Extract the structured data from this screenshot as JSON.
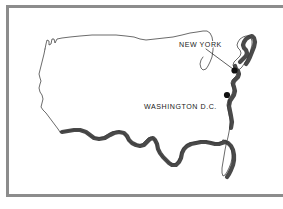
{
  "figure": {
    "background_color": "#ffffff",
    "frame_color": "#8c8c8c",
    "outline_color": "#3a3a3a",
    "shadow_color": "#4a4a4a",
    "marker_color": "#111111"
  },
  "map": {
    "region_name": "United States",
    "labels": [
      {
        "id": "new-york",
        "text": "NEW YORK",
        "text_x": 179,
        "text_y": 47,
        "marker_x": 234.5,
        "marker_y": 70.5,
        "marker_radius": 3.1,
        "leader_from_x": 206,
        "leader_from_y": 49,
        "leader_to_x": 233,
        "leader_to_y": 69
      },
      {
        "id": "washington-dc",
        "text": "WASHINGTON D.C.",
        "text_x": 144,
        "text_y": 109,
        "marker_x": 227,
        "marker_y": 95,
        "marker_radius": 3.1,
        "leader_from_x": 229,
        "leader_from_y": 105,
        "leader_to_x": 229,
        "leader_to_y": 99
      }
    ],
    "outline_path": "M 45,49 L 46,44 L 47,40 L 49,41 L 49,45 L 51,44 L 52,39 L 54,39 L 55,43 L 57,39 L 62,38 L 70,37 L 80,36 L 92,35 L 104,35 L 116,35 L 126,36 L 134,37 L 140,39 L 146,40 L 155,39 L 164,38 L 173,37 L 182,35 L 190,33 L 197,32 L 203,31 L 207,31 L 210,33 L 212,37 L 213,43 L 213,50 L 212,57 L 210,62 L 208,66 L 206,69 L 203,70 L 201,68 L 200,64 L 201,60 L 203,57",
    "west_path": "M 45,49 L 44,54 L 43,58 L 42,62 L 41,66 L 40,70 L 39,74 L 40,78 L 41,81 L 40,84 L 39,88 L 40,92 L 42,95 L 43,99 L 42,103 L 41,107 L 43,110 L 46,113 L 49,117 L 52,121 L 55,125 L 58,129 L 60,132",
    "south_path": "M 60,132 L 66,131 L 72,130 L 78,130 L 84,131 L 88,134 L 92,137 L 97,138 L 103,137 L 108,134 L 112,132 L 117,131 L 122,132 L 125,135 L 127,139 L 130,142 L 134,144 L 138,145 L 142,144 L 145,141 L 148,138 L 151,137 L 154,139 L 156,143 L 157,148 L 159,152 L 162,156 L 165,159 L 168,162 L 171,164 L 175,164 L 178,161 L 180,157 L 181,152 L 183,148 L 186,145 L 190,143 L 195,142 L 200,141 L 205,141 L 210,142 L 214,143 L 218,143 L 221,142 L 223,140",
    "east_path": "M 223,140 L 226,141 L 229,144 L 231,148 L 232,153 L 232,158 L 231,163 L 229,168 L 227,172 L 225,175 L 223,176 L 222,173 L 222,168 L 223,162 L 224,156 L 225,150 L 226,145 L 227,141 L 228,137 L 229,132 L 230,126 L 230,120 L 229,115 L 228,110 L 227,105 L 228,100 L 230,97 L 232,94 L 233,90 L 232,86 L 231,83 L 232,80 L 234,78 L 236,76 L 237,73 L 236,70 L 234,68 L 233,65 L 234,62 L 236,60 L 238,58 L 240,56 L 241,53 L 240,50 L 238,48 L 237,45 L 238,42 L 240,39 L 243,37 L 246,36 L 249,36 L 251,38 L 252,41 L 252,45 L 251,49 L 250,53 L 248,57 L 246,61 L 244,64 L 242,67 L 240,69 L 238,70",
    "shadow_segments": [
      "M 62,132 L 68,131 L 74,130 L 80,130 L 86,132 L 90,135 L 94,138 L 99,139 L 105,138 L 110,135 L 114,133 L 119,132 L 124,133 L 127,136 L 129,140 L 132,143 L 136,145 L 140,146 L 144,145 L 147,142 L 150,139 L 153,138 L 155,140 L 157,144 L 158,149 L 160,153 L 163,157 L 166,160 L 169,163 L 172,165 L 176,165 L 179,162 L 181,158 L 182,153 L 184,149 L 187,146 L 191,144 L 196,143 L 201,142 L 206,142 L 211,143 L 215,144 L 219,144 L 222,143 L 225,142",
      "M 225,142 L 228,143 L 231,146 L 233,150 L 234,155 L 234,160 L 233,165 L 231,170 L 229,174 L 227,177",
      "M 231,128 L 232,122 L 231,116 L 230,111 L 229,106 L 230,101 L 232,98 L 234,95 L 235,91 L 234,87 L 233,84 L 234,81 L 236,79 L 238,77 L 239,74 L 238,71 L 236,69 L 235,66",
      "M 240,62 L 242,60 L 244,58 L 246,56 L 247,53 L 246,50 L 244,48 L 243,45 L 244,42 L 246,39 L 249,37 L 252,36 L 254,38 L 255,42 L 254,47 L 252,52 L 250,57 L 248,61 L 246,64"
    ]
  }
}
